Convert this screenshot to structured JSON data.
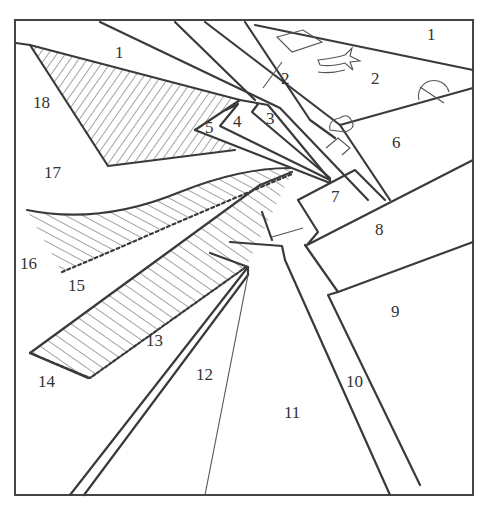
{
  "figure": {
    "type": "numbered line drawing",
    "frame_color": "#444444",
    "line_color": "#3a3a3a",
    "regions": [
      {
        "id": "r1a",
        "label": "1",
        "x": 120,
        "y": 57
      },
      {
        "id": "r1b",
        "label": "1",
        "x": 432,
        "y": 40
      },
      {
        "id": "r2a",
        "label": "2",
        "x": 286,
        "y": 84
      },
      {
        "id": "r2b",
        "label": "2",
        "x": 376,
        "y": 85
      },
      {
        "id": "r3",
        "label": "3",
        "x": 271,
        "y": 124
      },
      {
        "id": "r4",
        "label": "4",
        "x": 238,
        "y": 127
      },
      {
        "id": "r5",
        "label": "5",
        "x": 210,
        "y": 133
      },
      {
        "id": "r6",
        "label": "6",
        "x": 397,
        "y": 148
      },
      {
        "id": "r7",
        "label": "7",
        "x": 336,
        "y": 201
      },
      {
        "id": "r8",
        "label": "8",
        "x": 380,
        "y": 235
      },
      {
        "id": "r9",
        "label": "9",
        "x": 396,
        "y": 317
      },
      {
        "id": "r10",
        "label": "10",
        "x": 356,
        "y": 387
      },
      {
        "id": "r11",
        "label": "11",
        "x": 293,
        "y": 418
      },
      {
        "id": "r12",
        "label": "12",
        "x": 206,
        "y": 380
      },
      {
        "id": "r13",
        "label": "13",
        "x": 156,
        "y": 346
      },
      {
        "id": "r14",
        "label": "14",
        "x": 48,
        "y": 387
      },
      {
        "id": "r15",
        "label": "15",
        "x": 78,
        "y": 291
      },
      {
        "id": "r16",
        "label": "16",
        "x": 30,
        "y": 269
      },
      {
        "id": "r17",
        "label": "17",
        "x": 54,
        "y": 178
      },
      {
        "id": "r18",
        "label": "18",
        "x": 43,
        "y": 107
      }
    ]
  }
}
